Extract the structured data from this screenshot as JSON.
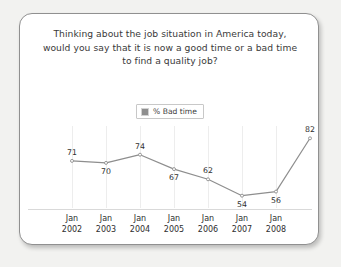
{
  "card": {
    "background": "#ffffff",
    "border_color": "#909090"
  },
  "chart_data": {
    "type": "line",
    "title": "Thinking about the job situation in America today, would you say that it is now a good time or a bad time to find a quality job?",
    "title_lines": [
      "Thinking about the job situation in America today,",
      "would you say that it is now a good time or a bad time",
      "to find a quality job?"
    ],
    "categories": [
      "Jan 2002",
      "Jan 2003",
      "Jan 2004",
      "Jan 2005",
      "Jan 2006",
      "Jan 2007",
      "Jan 2008",
      ""
    ],
    "x_tick_lines": [
      [
        "Jan",
        "2002"
      ],
      [
        "Jan",
        "2003"
      ],
      [
        "Jan",
        "2004"
      ],
      [
        "Jan",
        "2005"
      ],
      [
        "Jan",
        "2006"
      ],
      [
        "Jan",
        "2007"
      ],
      [
        "Jan",
        "2008"
      ]
    ],
    "values": [
      71,
      70,
      74,
      67,
      62,
      54,
      56,
      82
    ],
    "point_labels": [
      "71",
      "70",
      "74",
      "67",
      "62",
      "54",
      "56",
      "82"
    ],
    "label_positions": [
      "above",
      "below",
      "above",
      "below",
      "above",
      "below",
      "below",
      "above"
    ],
    "series": [
      {
        "name": "% Bad time",
        "values": [
          71,
          70,
          74,
          67,
          62,
          54,
          56,
          82
        ],
        "color": "#8e8e8e"
      }
    ],
    "legend": {
      "entries": [
        "% Bad time"
      ],
      "position": "top-center",
      "swatch_color": "#8e8e8e"
    },
    "xlabel": "",
    "ylabel": "",
    "ylim": [
      48,
      88
    ],
    "grid": "vertical-only",
    "axis_color": "#d9d9d9",
    "line_color": "#8e8e8e",
    "marker": "dot"
  }
}
